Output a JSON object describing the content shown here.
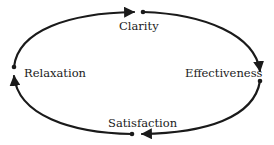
{
  "diagram": {
    "type": "cycle",
    "direction": "clockwise",
    "nodes": [
      {
        "id": "clarity",
        "label": "Clarity"
      },
      {
        "id": "effectiveness",
        "label": "Effectiveness"
      },
      {
        "id": "satisfaction",
        "label": "Satisfaction"
      },
      {
        "id": "relaxation",
        "label": "Relaxation"
      }
    ],
    "edges": [
      {
        "from": "clarity",
        "to": "effectiveness"
      },
      {
        "from": "effectiveness",
        "to": "satisfaction"
      },
      {
        "from": "satisfaction",
        "to": "relaxation"
      },
      {
        "from": "relaxation",
        "to": "clarity"
      }
    ],
    "colors": {
      "stroke": "#1a1a1a",
      "background": "#ffffff"
    }
  }
}
